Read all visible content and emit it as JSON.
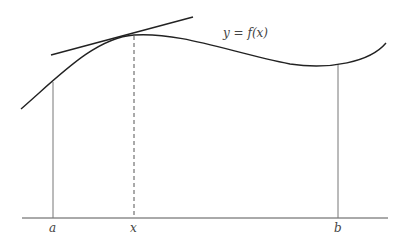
{
  "diagram": {
    "curve_label": "y = f(x)",
    "axis_labels": {
      "a": "a",
      "x": "x",
      "b": "b"
    },
    "colors": {
      "stroke": "#222222",
      "thin": "#666666",
      "background": "#ffffff"
    }
  }
}
